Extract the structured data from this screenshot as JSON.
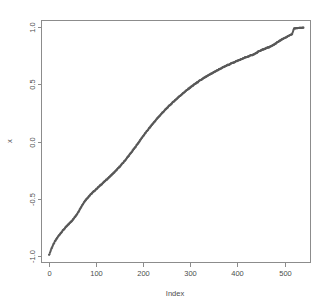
{
  "chart_data": {
    "type": "scatter",
    "title": "",
    "subtitle": "",
    "xlabel": "Index",
    "ylabel": "x",
    "xlim": [
      -15,
      555
    ],
    "ylim": [
      -1.06,
      1.06
    ],
    "xticks": [
      0,
      100,
      200,
      300,
      400,
      500
    ],
    "xtick_labels": [
      "0",
      "100",
      "200",
      "300",
      "400",
      "500"
    ],
    "yticks": [
      -1.0,
      -0.5,
      0.0,
      0.5,
      1.0
    ],
    "ytick_labels": [
      "-1.0",
      "-0.5",
      "0.0",
      "0.5",
      "1.0"
    ],
    "grid": false,
    "legend": null,
    "point_color": "#595959",
    "axis_color": "#8c8c8c",
    "background_color": "#ffffff",
    "marker": "dot",
    "marker_size": 1.1,
    "n_points": 540,
    "series": [
      {
        "name": "x",
        "x": [
          1,
          3,
          5,
          7,
          9,
          11,
          13,
          15,
          18,
          21,
          24,
          27,
          30,
          33,
          36,
          39,
          42,
          45,
          48,
          51,
          54,
          57,
          60,
          63,
          66,
          69,
          72,
          75,
          78,
          81,
          84,
          87,
          90,
          93,
          96,
          99,
          104,
          109,
          114,
          119,
          124,
          129,
          134,
          139,
          144,
          149,
          154,
          159,
          164,
          169,
          174,
          179,
          184,
          189,
          194,
          199,
          206,
          213,
          220,
          227,
          234,
          241,
          248,
          255,
          262,
          269,
          276,
          283,
          290,
          297,
          304,
          311,
          318,
          325,
          332,
          339,
          346,
          353,
          360,
          367,
          374,
          381,
          388,
          395,
          402,
          409,
          416,
          423,
          430,
          437,
          444,
          451,
          458,
          465,
          472,
          479,
          486,
          493,
          500,
          507,
          513,
          516,
          520,
          524,
          528,
          532,
          536,
          540
        ],
        "y": [
          -0.995,
          -0.975,
          -0.95,
          -0.93,
          -0.912,
          -0.896,
          -0.88,
          -0.866,
          -0.846,
          -0.828,
          -0.812,
          -0.796,
          -0.781,
          -0.767,
          -0.753,
          -0.74,
          -0.727,
          -0.714,
          -0.7,
          -0.687,
          -0.672,
          -0.655,
          -0.637,
          -0.617,
          -0.596,
          -0.574,
          -0.552,
          -0.533,
          -0.516,
          -0.501,
          -0.487,
          -0.474,
          -0.461,
          -0.449,
          -0.437,
          -0.425,
          -0.406,
          -0.387,
          -0.368,
          -0.349,
          -0.33,
          -0.311,
          -0.291,
          -0.271,
          -0.25,
          -0.228,
          -0.205,
          -0.181,
          -0.156,
          -0.13,
          -0.103,
          -0.076,
          -0.048,
          -0.019,
          0.01,
          0.04,
          0.078,
          0.115,
          0.151,
          0.186,
          0.219,
          0.251,
          0.281,
          0.31,
          0.338,
          0.365,
          0.391,
          0.416,
          0.44,
          0.463,
          0.485,
          0.506,
          0.526,
          0.545,
          0.563,
          0.58,
          0.597,
          0.613,
          0.629,
          0.644,
          0.658,
          0.672,
          0.685,
          0.698,
          0.71,
          0.722,
          0.734,
          0.745,
          0.756,
          0.767,
          0.785,
          0.8,
          0.812,
          0.823,
          0.834,
          0.852,
          0.872,
          0.89,
          0.906,
          0.922,
          0.935,
          0.94,
          0.99,
          0.992,
          0.994,
          0.995,
          0.996,
          0.997
        ]
      }
    ]
  }
}
